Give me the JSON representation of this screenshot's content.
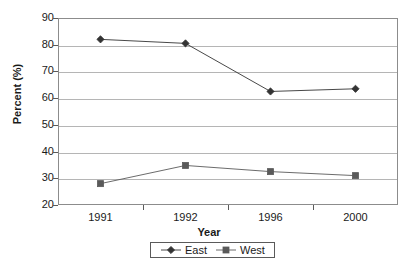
{
  "chart_data": {
    "type": "line",
    "title": "",
    "xlabel": "Year",
    "ylabel": "Percent (%)",
    "categories": [
      "1991",
      "1992",
      "1996",
      "2000"
    ],
    "ylim": [
      20,
      90
    ],
    "yticks": [
      20,
      30,
      40,
      50,
      60,
      70,
      80,
      90
    ],
    "grid": true,
    "legend_position": "bottom",
    "series": [
      {
        "name": "East",
        "marker": "diamond",
        "color": "#333333",
        "values": [
          82,
          80.5,
          62.5,
          63.5
        ]
      },
      {
        "name": "West",
        "marker": "square",
        "color": "#5a5a5a",
        "values": [
          28,
          34.8,
          32.5,
          31
        ]
      }
    ]
  },
  "axis": {
    "y_title": "Percent (%)",
    "x_title": "Year"
  },
  "colors": {
    "grid": "#b5b5b5",
    "frame": "#8c8c8c",
    "east": "#333333",
    "west": "#5a5a5a"
  }
}
